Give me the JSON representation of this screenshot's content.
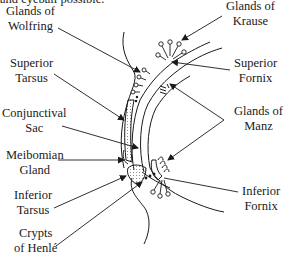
{
  "top_text": "and eyeball possible.",
  "labels": {
    "glands_of_wolfring": [
      "Glands of",
      "Wolfring"
    ],
    "superior_tarsus": [
      "Superior",
      "Tarsus"
    ],
    "conjunctival_sac": [
      "Conjunctival",
      "Sac"
    ],
    "meibomian_gland": [
      "Meibomian",
      "Gland"
    ],
    "inferior_tarsus": [
      "Inferior",
      "Tarsus"
    ],
    "crypts_of_henle": [
      "Crypts",
      "of Henlé"
    ],
    "glands_of_krause": [
      "Glands of",
      "Krause"
    ],
    "superior_fornix": [
      "Superior",
      "Fornix"
    ],
    "glands_of_manz": [
      "Glands of",
      "Manz"
    ],
    "inferior_fornix": [
      "Inferior",
      "Fornix"
    ]
  },
  "colors": {
    "line": "#1a1a1a",
    "background": "#ffffff"
  }
}
